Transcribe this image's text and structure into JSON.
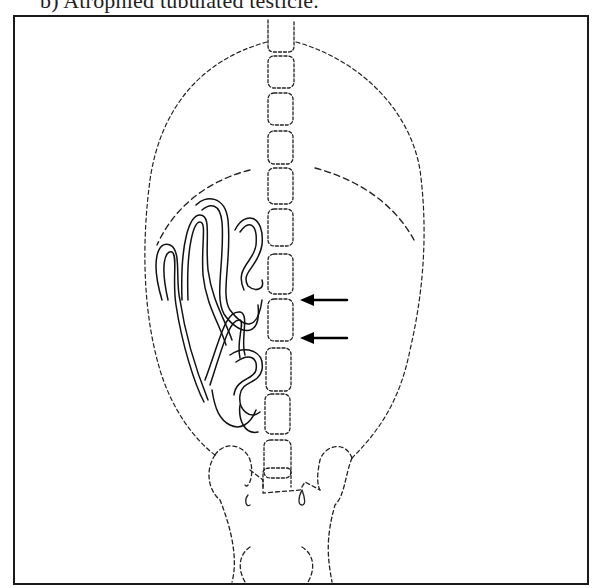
{
  "caption": {
    "text": "b) Atrophied tubulated testicle.",
    "cropped": true
  },
  "figure": {
    "type": "line-drawing",
    "arrows": [
      {
        "label": "",
        "direction": "left"
      },
      {
        "label": "",
        "direction": "left"
      }
    ],
    "central_segment_count": 13,
    "colors": {
      "line": "#1a1a1a",
      "background": "#ffffff"
    }
  }
}
